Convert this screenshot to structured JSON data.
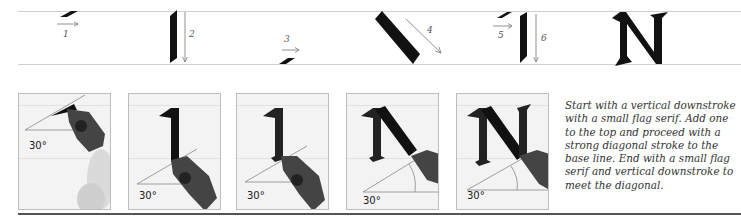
{
  "stroke_sequence": {
    "steps": [
      {
        "number": "1",
        "description": "small flag serif stroke, left to right"
      },
      {
        "number": "2",
        "description": "vertical downstroke"
      },
      {
        "number": "3",
        "description": "small flag serif at base line"
      },
      {
        "number": "4",
        "description": "diagonal stroke to base line"
      },
      {
        "number": "5",
        "description": "small flag serif at top"
      },
      {
        "number": "6",
        "description": "vertical downstroke"
      }
    ],
    "result_letter": "N"
  },
  "panels": [
    {
      "angle_label": "30°",
      "stage": "pen at start, 30 degree angle"
    },
    {
      "angle_label": "30°",
      "stage": "first vertical downstroke"
    },
    {
      "angle_label": "30°",
      "stage": "downstroke with base flag serif"
    },
    {
      "angle_label": "30°",
      "stage": "diagonal stroke"
    },
    {
      "angle_label": "30°",
      "stage": "completed N"
    }
  ],
  "caption": "Start with a vertical downstroke with a small flag serif. Add one to the top and proceed with a strong diagonal stroke to the base line. End with a small flag serif and vertical downstroke to meet the diagonal."
}
